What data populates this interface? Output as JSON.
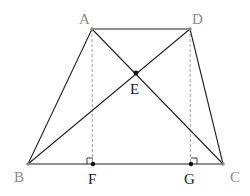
{
  "diagram": {
    "type": "trapezoid-with-diagonals",
    "colors": {
      "line": "#222222",
      "dashed": "#999999",
      "vertex": "#8a8a8a",
      "point": "#111111"
    },
    "points": {
      "A": {
        "label": "A",
        "x": 92,
        "y": 29
      },
      "D": {
        "label": "D",
        "x": 190,
        "y": 29
      },
      "B": {
        "label": "B",
        "x": 28,
        "y": 164
      },
      "C": {
        "label": "C",
        "x": 223,
        "y": 164
      },
      "E": {
        "label": "E",
        "x": 136,
        "y": 73
      },
      "F": {
        "label": "F",
        "x": 93,
        "y": 164
      },
      "G": {
        "label": "G",
        "x": 191,
        "y": 164
      }
    },
    "segments": [
      "AD",
      "AB",
      "DC",
      "BC",
      "AC",
      "BD"
    ],
    "dashed_segments": [
      "AF",
      "DG"
    ],
    "right_angles": [
      "F",
      "G"
    ]
  }
}
